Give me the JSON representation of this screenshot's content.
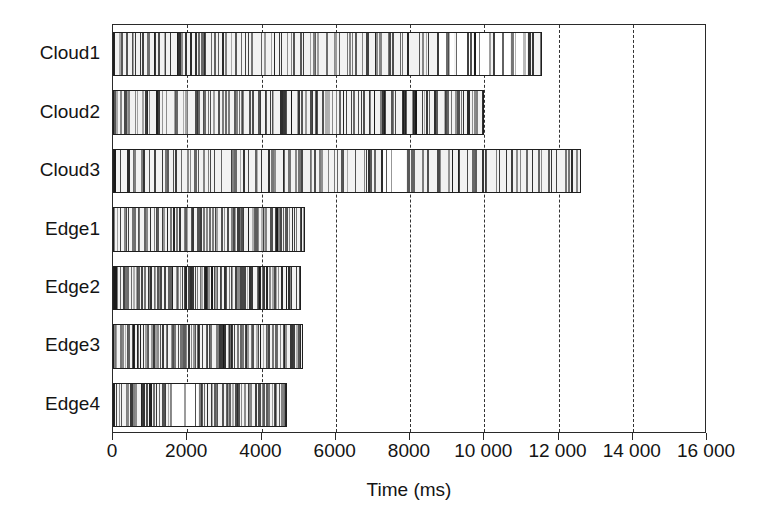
{
  "chart_data": {
    "type": "bar",
    "subtype": "gantt-timeline-strips",
    "title": "",
    "xlabel": "Time (ms)",
    "ylabel": "",
    "xlim": [
      0,
      16000
    ],
    "ylim": [
      0,
      7
    ],
    "grid": true,
    "grid_axis": "x",
    "grid_style": "dashed",
    "legend": "none",
    "categories": [
      "Cloud1",
      "Cloud2",
      "Cloud3",
      "Edge1",
      "Edge2",
      "Edge3",
      "Edge4"
    ],
    "values": [
      11560,
      9990,
      12600,
      5170,
      5070,
      5120,
      4690
    ],
    "value_unit": "ms",
    "xticks": [
      0,
      2000,
      4000,
      6000,
      8000,
      10000,
      12000,
      14000,
      16000
    ],
    "xticklabels": [
      "0",
      "2000",
      "4000",
      "6000",
      "8000",
      "10 000",
      "12 000",
      "14 000",
      "16 000"
    ],
    "series": [
      {
        "name": "Cloud1",
        "total_ms": 11560,
        "busy_intervals": [
          [
            0,
            330
          ],
          [
            330,
            560
          ],
          [
            560,
            900
          ],
          [
            900,
            1180
          ],
          [
            1180,
            1500
          ],
          [
            1500,
            1760
          ],
          [
            1760,
            2050
          ],
          [
            2050,
            2340
          ],
          [
            2340,
            2600
          ],
          [
            2600,
            2900
          ],
          [
            2900,
            3250
          ],
          [
            3250,
            3600
          ],
          [
            3600,
            3950
          ],
          [
            3950,
            4300
          ],
          [
            4300,
            4650
          ],
          [
            4650,
            5000
          ],
          [
            5000,
            5350
          ],
          [
            5350,
            5700
          ],
          [
            5700,
            6050
          ],
          [
            6050,
            6400
          ],
          [
            6400,
            6800
          ],
          [
            6800,
            7150
          ],
          [
            7150,
            7500
          ],
          [
            7500,
            7900
          ],
          [
            7900,
            8300
          ],
          [
            8300,
            8700
          ],
          [
            8700,
            9200
          ],
          [
            9200,
            9700
          ],
          [
            9700,
            10200
          ],
          [
            10200,
            10700
          ],
          [
            10700,
            11160
          ],
          [
            11160,
            11560
          ]
        ]
      },
      {
        "name": "Cloud2",
        "total_ms": 9990,
        "busy_intervals": [
          [
            0,
            280
          ],
          [
            280,
            560
          ],
          [
            560,
            840
          ],
          [
            840,
            1120
          ],
          [
            1120,
            1400
          ],
          [
            1400,
            1680
          ],
          [
            1680,
            1960
          ],
          [
            1960,
            2240
          ],
          [
            2240,
            2520
          ],
          [
            2520,
            2800
          ],
          [
            2800,
            3080
          ],
          [
            3080,
            3360
          ],
          [
            3360,
            3640
          ],
          [
            3640,
            3920
          ],
          [
            3920,
            4200
          ],
          [
            4200,
            4480
          ],
          [
            4480,
            4760
          ],
          [
            4760,
            5040
          ],
          [
            5040,
            5320
          ],
          [
            5320,
            5600
          ],
          [
            5600,
            5880
          ],
          [
            5880,
            6160
          ],
          [
            6160,
            6440
          ],
          [
            6440,
            6720
          ],
          [
            6720,
            7000
          ],
          [
            7000,
            7280
          ],
          [
            7280,
            7560
          ],
          [
            7560,
            7840
          ],
          [
            7840,
            8120
          ],
          [
            8120,
            8400
          ],
          [
            8400,
            8680
          ],
          [
            8680,
            8960
          ],
          [
            8960,
            9240
          ],
          [
            9240,
            9520
          ],
          [
            9520,
            9750
          ],
          [
            9750,
            9990
          ]
        ]
      },
      {
        "name": "Cloud3",
        "total_ms": 12600,
        "busy_intervals": [
          [
            0,
            360
          ],
          [
            360,
            720
          ],
          [
            720,
            1080
          ],
          [
            1080,
            1440
          ],
          [
            1440,
            1800
          ],
          [
            1800,
            2160
          ],
          [
            2160,
            2520
          ],
          [
            2520,
            2880
          ],
          [
            2880,
            3240
          ],
          [
            3240,
            3600
          ],
          [
            3600,
            3960
          ],
          [
            3960,
            4320
          ],
          [
            4320,
            4680
          ],
          [
            4680,
            5040
          ],
          [
            5040,
            5400
          ],
          [
            5400,
            5760
          ],
          [
            5760,
            6120
          ],
          [
            6120,
            6480
          ],
          [
            6480,
            6840
          ],
          [
            6840,
            7200
          ],
          [
            7200,
            7900
          ],
          [
            7900,
            8300
          ],
          [
            8300,
            8700
          ],
          [
            8700,
            9100
          ],
          [
            9100,
            9500
          ],
          [
            9500,
            9900
          ],
          [
            9900,
            10300
          ],
          [
            10300,
            10700
          ],
          [
            10700,
            11100
          ],
          [
            11100,
            11500
          ],
          [
            11500,
            11900
          ],
          [
            11900,
            12300
          ],
          [
            12300,
            12600
          ]
        ]
      },
      {
        "name": "Edge1",
        "total_ms": 5170,
        "busy_intervals": [
          [
            0,
            160
          ],
          [
            160,
            320
          ],
          [
            320,
            480
          ],
          [
            480,
            640
          ],
          [
            640,
            800
          ],
          [
            800,
            960
          ],
          [
            960,
            1120
          ],
          [
            1120,
            1280
          ],
          [
            1280,
            1440
          ],
          [
            1440,
            1600
          ],
          [
            1600,
            1760
          ],
          [
            1760,
            1920
          ],
          [
            1920,
            2080
          ],
          [
            2080,
            2240
          ],
          [
            2240,
            2400
          ],
          [
            2400,
            2560
          ],
          [
            2560,
            2720
          ],
          [
            2720,
            2880
          ],
          [
            2880,
            3040
          ],
          [
            3040,
            3200
          ],
          [
            3200,
            3400
          ],
          [
            3400,
            3600
          ],
          [
            3600,
            3800
          ],
          [
            3800,
            4000
          ],
          [
            4000,
            4200
          ],
          [
            4200,
            4400
          ],
          [
            4400,
            4600
          ],
          [
            4600,
            4800
          ],
          [
            4800,
            5000
          ],
          [
            5000,
            5170
          ]
        ]
      },
      {
        "name": "Edge2",
        "total_ms": 5070,
        "busy_intervals": [
          [
            0,
            150
          ],
          [
            150,
            300
          ],
          [
            300,
            450
          ],
          [
            450,
            620
          ],
          [
            620,
            800
          ],
          [
            800,
            980
          ],
          [
            980,
            1160
          ],
          [
            1160,
            1340
          ],
          [
            1340,
            1520
          ],
          [
            1520,
            1700
          ],
          [
            1700,
            1880
          ],
          [
            1880,
            2060
          ],
          [
            2060,
            2240
          ],
          [
            2240,
            2420
          ],
          [
            2420,
            2600
          ],
          [
            2600,
            2780
          ],
          [
            2780,
            2960
          ],
          [
            2960,
            3140
          ],
          [
            3140,
            3320
          ],
          [
            3320,
            3500
          ],
          [
            3500,
            3700
          ],
          [
            3700,
            3900
          ],
          [
            3900,
            4100
          ],
          [
            4100,
            4300
          ],
          [
            4300,
            4500
          ],
          [
            4500,
            4700
          ],
          [
            4700,
            4890
          ],
          [
            4890,
            5070
          ]
        ]
      },
      {
        "name": "Edge3",
        "total_ms": 5120,
        "busy_intervals": [
          [
            0,
            170
          ],
          [
            170,
            340
          ],
          [
            340,
            520
          ],
          [
            520,
            700
          ],
          [
            700,
            880
          ],
          [
            880,
            1060
          ],
          [
            1060,
            1240
          ],
          [
            1240,
            1420
          ],
          [
            1420,
            1600
          ],
          [
            1600,
            1790
          ],
          [
            1790,
            1980
          ],
          [
            1980,
            2170
          ],
          [
            2170,
            2360
          ],
          [
            2360,
            2550
          ],
          [
            2550,
            2740
          ],
          [
            2740,
            2930
          ],
          [
            2930,
            3120
          ],
          [
            3120,
            3320
          ],
          [
            3320,
            3520
          ],
          [
            3520,
            3720
          ],
          [
            3720,
            3920
          ],
          [
            3920,
            4120
          ],
          [
            4120,
            4330
          ],
          [
            4330,
            4540
          ],
          [
            4540,
            4750
          ],
          [
            4750,
            4950
          ],
          [
            4950,
            5120
          ]
        ]
      },
      {
        "name": "Edge4",
        "total_ms": 4690,
        "busy_intervals": [
          [
            0,
            180
          ],
          [
            180,
            370
          ],
          [
            370,
            560
          ],
          [
            560,
            750
          ],
          [
            750,
            940
          ],
          [
            940,
            1130
          ],
          [
            1130,
            1320
          ],
          [
            1320,
            1500
          ],
          [
            1500,
            2300
          ],
          [
            2300,
            2500
          ],
          [
            2500,
            2700
          ],
          [
            2700,
            2900
          ],
          [
            2900,
            3100
          ],
          [
            3100,
            3300
          ],
          [
            3300,
            3500
          ],
          [
            3500,
            3700
          ],
          [
            3700,
            3900
          ],
          [
            3900,
            4100
          ],
          [
            4100,
            4300
          ],
          [
            4300,
            4500
          ],
          [
            4500,
            4690
          ]
        ]
      }
    ]
  },
  "axis": {
    "x_title": "Time (ms)"
  },
  "colors": {
    "background": "#ffffff",
    "axis": "#2a2a2a",
    "bar_fill": "#f2f2f2",
    "bar_border": "#1e1e1e",
    "stripe": "#1a1a1a",
    "grid": "#333333",
    "text": "#141414"
  }
}
